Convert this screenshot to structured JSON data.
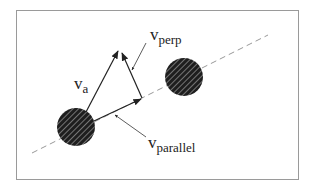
{
  "diagram": {
    "labels": {
      "va": {
        "main": "v",
        "sub": "a"
      },
      "vperp": {
        "main": "v",
        "sub": "perp"
      },
      "vparallel": {
        "main": "v",
        "sub": "parallel"
      }
    },
    "colors": {
      "frame": "#9a9a9a",
      "ink": "#222222",
      "dash": "#999999"
    }
  }
}
